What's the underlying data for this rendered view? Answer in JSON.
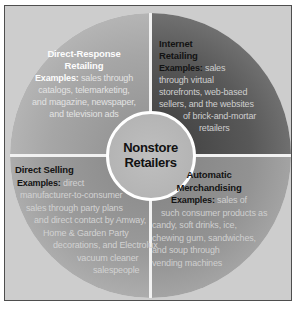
{
  "figure": {
    "center": {
      "lines": [
        "Nonstore",
        "Retailers"
      ]
    },
    "quadrants": {
      "top_left": {
        "title_lines": [
          "Direct-Response",
          "Retailing"
        ],
        "body_lines": [
          "Examples: sales through",
          "catalogs, telemarketing,",
          "and magazine, newspaper,",
          "and television ads"
        ]
      },
      "top_right": {
        "title_lines": [
          "Internet",
          "Retailing"
        ],
        "body_lines": [
          "Examples: sales",
          "through virtual",
          "storefronts, web-based",
          "sellers, and the websites",
          "of brick-and-mortar",
          "retailers"
        ]
      },
      "bottom_left": {
        "title_lines": [
          "Direct Selling"
        ],
        "body_lines": [
          "Examples: direct",
          "manufacturer-to-consumer",
          "sales through party plans",
          "and direct contact by Amway,",
          "Home & Garden Party",
          "decorations, and Electrolux",
          "vacuum cleaner",
          "salespeople"
        ]
      },
      "bottom_right": {
        "title_lines": [
          "Automatic",
          "Merchandising"
        ],
        "body_lines": [
          "Examples: sales of",
          "such consumer products as",
          "candy, soft drinks, ice,",
          "chewing gum, sandwiches,",
          "and soup through",
          "vending machines"
        ]
      }
    },
    "colors": {
      "frame_background": "#cdcdcd",
      "frame_border": "#4e4e4e",
      "quadrant_top_left": "#a0a0a0",
      "quadrant_top_right": "#4a4a4a",
      "quadrant_bottom_left": "#9a9a9a",
      "quadrant_bottom_right": "#8f8f8f",
      "hub_fill": "#b5b5b5",
      "divider": "#ffffff"
    }
  }
}
